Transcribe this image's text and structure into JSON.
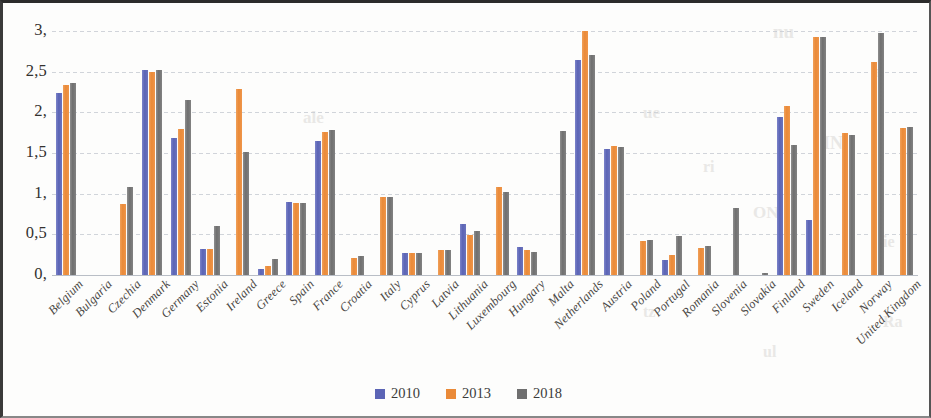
{
  "chart_data": {
    "type": "bar",
    "title": "",
    "xlabel": "",
    "ylabel": "",
    "ylim": [
      0,
      3
    ],
    "ytick_labels": [
      "3,",
      "2,5",
      "2,",
      "1,5",
      "1,",
      "0,5",
      "0,"
    ],
    "ytick_values": [
      3,
      2.5,
      2,
      1.5,
      1,
      0.5,
      0
    ],
    "grid": true,
    "legend_position": "bottom",
    "categories": [
      "Belgium",
      "Bulgaria",
      "Czechia",
      "Denmark",
      "Germany",
      "Estonia",
      "Ireland",
      "Greece",
      "Spain",
      "France",
      "Croatia",
      "Italy",
      "Cyprus",
      "Latvia",
      "Lithuania",
      "Luxembourg",
      "Hungary",
      "Malta",
      "Netherlands",
      "Austria",
      "Poland",
      "Portugal",
      "Romania",
      "Slovenia",
      "Slovakia",
      "Finland",
      "Sweden",
      "Iceland",
      "Norway",
      "United Kingdom"
    ],
    "series": [
      {
        "name": "2010",
        "color": "#5b64b5",
        "values": [
          2.24,
          null,
          null,
          2.52,
          1.69,
          0.32,
          null,
          0.08,
          0.9,
          1.65,
          null,
          null,
          0.27,
          null,
          0.63,
          null,
          0.34,
          null,
          2.64,
          1.55,
          null,
          0.19,
          null,
          null,
          null,
          1.94,
          0.68,
          null,
          null,
          null
        ]
      },
      {
        "name": "2013",
        "color": "#ea8a38",
        "values": [
          2.34,
          null,
          0.87,
          2.5,
          1.79,
          0.32,
          2.29,
          0.11,
          0.89,
          1.76,
          0.21,
          0.96,
          0.27,
          0.31,
          0.49,
          1.08,
          0.31,
          null,
          3.0,
          1.59,
          0.42,
          0.25,
          0.33,
          null,
          null,
          2.08,
          2.93,
          1.74,
          2.62,
          1.81
        ]
      },
      {
        "name": "2018",
        "color": "#6f6f6f",
        "values": [
          2.36,
          null,
          1.08,
          2.52,
          2.15,
          0.6,
          1.51,
          0.2,
          0.89,
          1.78,
          0.23,
          0.96,
          0.27,
          0.31,
          0.54,
          1.02,
          0.28,
          1.77,
          2.7,
          1.58,
          0.43,
          0.48,
          0.36,
          0.83,
          0.03,
          1.6,
          2.93,
          1.72,
          2.98,
          1.82
        ]
      }
    ]
  },
  "legend": {
    "items": [
      {
        "label": "2010",
        "color": "#5b64b5"
      },
      {
        "label": "2013",
        "color": "#ea8a38"
      },
      {
        "label": "2018",
        "color": "#6f6f6f"
      }
    ]
  },
  "bleed_text": [
    {
      "text": "nu",
      "x": 770,
      "y": 18,
      "size": 19
    },
    {
      "text": "ale",
      "x": 300,
      "y": 105,
      "size": 17
    },
    {
      "text": "ue",
      "x": 640,
      "y": 100,
      "size": 17
    },
    {
      "text": "a",
      "x": 870,
      "y": 60,
      "size": 16
    },
    {
      "text": "ri",
      "x": 700,
      "y": 155,
      "size": 16
    },
    {
      "text": "IN",
      "x": 820,
      "y": 130,
      "size": 18
    },
    {
      "text": "ON",
      "x": 750,
      "y": 200,
      "size": 17
    },
    {
      "text": "ie",
      "x": 880,
      "y": 230,
      "size": 16
    },
    {
      "text": "tz",
      "x": 640,
      "y": 300,
      "size": 16
    },
    {
      "text": "ul",
      "x": 760,
      "y": 340,
      "size": 16
    },
    {
      "text": "Ra",
      "x": 880,
      "y": 310,
      "size": 16
    }
  ]
}
